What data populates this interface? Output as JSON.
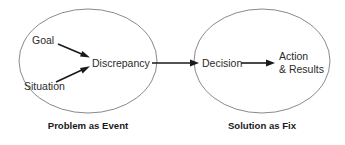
{
  "diagram": {
    "background_color": "#ffffff",
    "ellipse_stroke_color": "#8a8a8a",
    "text_color": "#2b2b2b",
    "caption_color": "#1a1a1a",
    "arrow_color": "#1a1a1a",
    "groups": [
      {
        "id": "problem-group",
        "caption": "Problem as Event",
        "nodes": [
          {
            "id": "goal",
            "label": "Goal"
          },
          {
            "id": "situation",
            "label": "Situation"
          },
          {
            "id": "discrepancy",
            "label": "Discrepancy"
          }
        ]
      },
      {
        "id": "solution-group",
        "caption": "Solution as Fix",
        "nodes": [
          {
            "id": "decision",
            "label": "Decision"
          },
          {
            "id": "action-results",
            "label_line1": "Action",
            "label_line2": "& Results"
          }
        ]
      }
    ],
    "edges": [
      {
        "id": "goal-to-discrepancy",
        "from": "goal",
        "to": "discrepancy"
      },
      {
        "id": "situation-to-discrepancy",
        "from": "situation",
        "to": "discrepancy"
      },
      {
        "id": "discrepancy-to-decision",
        "from": "discrepancy",
        "to": "decision"
      },
      {
        "id": "decision-to-action",
        "from": "decision",
        "to": "action-results"
      }
    ]
  }
}
